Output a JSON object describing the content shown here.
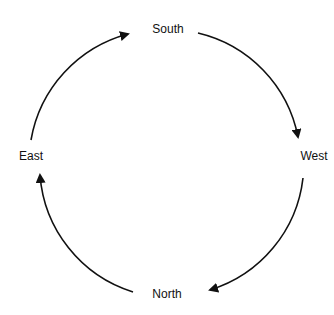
{
  "diagram": {
    "type": "cycle",
    "direction": "clockwise",
    "nodes": [
      {
        "id": "south",
        "label": "South",
        "x": 167,
        "y": 28
      },
      {
        "id": "west",
        "label": "West",
        "x": 315,
        "y": 156
      },
      {
        "id": "north",
        "label": "North",
        "x": 167,
        "y": 294
      },
      {
        "id": "east",
        "label": "East",
        "x": 31,
        "y": 155
      }
    ],
    "edges": [
      {
        "from": "South",
        "to": "West"
      },
      {
        "from": "West",
        "to": "North"
      },
      {
        "from": "North",
        "to": "East"
      },
      {
        "from": "East",
        "to": "South"
      }
    ],
    "colors": {
      "stroke": "#111111",
      "background": "#ffffff"
    }
  }
}
